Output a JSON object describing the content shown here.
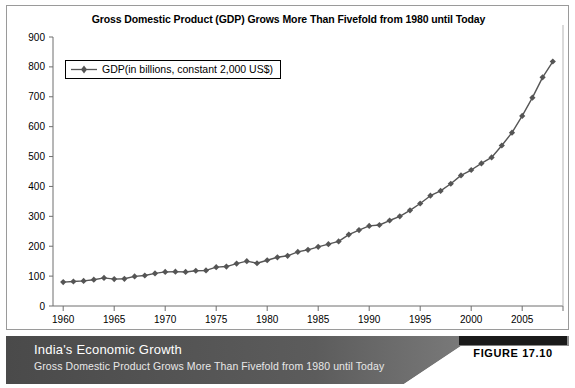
{
  "chart_data": {
    "type": "line",
    "title": "Gross Domestic Product (GDP) Grows More Than Fivefold from 1980 until Today",
    "xlabel": "",
    "ylabel": "",
    "ylim": [
      0,
      900
    ],
    "xlim": [
      1959,
      2009
    ],
    "ytick_step": 100,
    "xtick_step": 5,
    "grid": false,
    "legend_position": "top-left",
    "series": [
      {
        "name": "GDP(in billions, constant 2,000 US$)",
        "marker": "diamond",
        "color": "#555555",
        "x": [
          1960,
          1961,
          1962,
          1963,
          1964,
          1965,
          1966,
          1967,
          1968,
          1969,
          1970,
          1971,
          1972,
          1973,
          1974,
          1975,
          1976,
          1977,
          1978,
          1979,
          1980,
          1981,
          1982,
          1983,
          1984,
          1985,
          1986,
          1987,
          1988,
          1989,
          1990,
          1991,
          1992,
          1993,
          1994,
          1995,
          1996,
          1997,
          1998,
          1999,
          2000,
          2001,
          2002,
          2003,
          2004,
          2005,
          2006,
          2007,
          2008
        ],
        "values": [
          80,
          82,
          84,
          88,
          94,
          90,
          91,
          99,
          102,
          109,
          114,
          115,
          114,
          118,
          119,
          130,
          132,
          142,
          150,
          143,
          153,
          163,
          168,
          181,
          188,
          198,
          207,
          216,
          239,
          254,
          268,
          271,
          286,
          300,
          320,
          343,
          369,
          385,
          409,
          437,
          455,
          477,
          497,
          537,
          580,
          636,
          697,
          765,
          818
        ]
      }
    ],
    "yticks": [
      "0",
      "100",
      "200",
      "300",
      "400",
      "500",
      "600",
      "700",
      "800",
      "900"
    ],
    "xticks": [
      "1960",
      "1965",
      "1970",
      "1975",
      "1980",
      "1985",
      "1990",
      "1995",
      "2000",
      "2005"
    ]
  },
  "legend": {
    "label": "GDP(in billions, constant 2,000 US$)"
  },
  "footer": {
    "title": "India's Economic Growth",
    "subtitle": "Gross Domestic Product Grows More Than Fivefold from 1980 until Today",
    "figure_label": "FIGURE 17.10"
  },
  "colors": {
    "line": "#555555",
    "axis": "#6e6e6e",
    "band_dark": "#4f4f4f",
    "band_light": "#8c8c8c",
    "badge_bar": "#1a1a1a",
    "panel_border": "#9a9a9a"
  }
}
